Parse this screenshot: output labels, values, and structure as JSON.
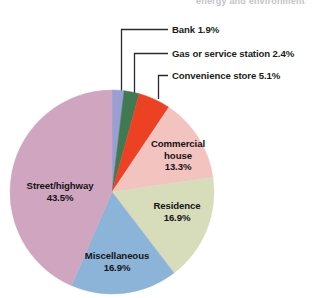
{
  "page": {
    "top_clipped_text": "energy and environment",
    "background_color": "#ffffff"
  },
  "chart_data": {
    "type": "pie",
    "title": "",
    "subtitle": "",
    "xlabel": "",
    "ylabel": "",
    "legend_position": "none",
    "grid": false,
    "label_format": "name + percent",
    "start_angle_deg": 0,
    "direction": "clockwise",
    "categories": [
      "Bank",
      "Gas or service station",
      "Convenience store",
      "Commercial house",
      "Residence",
      "Miscellaneous",
      "Street/highway"
    ],
    "values": [
      1.9,
      2.4,
      5.1,
      13.3,
      16.9,
      16.9,
      43.5
    ],
    "units": "percent",
    "colors": [
      "#9a9ed2",
      "#3f7a52",
      "#ec4123",
      "#f2c3bf",
      "#d7dcba",
      "#8cb4d8",
      "#d0a5c0"
    ],
    "slices": [
      {
        "name": "Bank",
        "value": 1.9,
        "display": "Bank 1.9%",
        "color": "#9a9ed2",
        "label_placement": "callout"
      },
      {
        "name": "Gas or service station",
        "value": 2.4,
        "display": "Gas or service station 2.4%",
        "color": "#3f7a52",
        "label_placement": "callout"
      },
      {
        "name": "Convenience store",
        "value": 5.1,
        "display": "Convenience store 5.1%",
        "color": "#ec4123",
        "label_placement": "callout"
      },
      {
        "name": "Commercial house",
        "value": 13.3,
        "display": "Commercial house 13.3%",
        "color": "#f2c3bf",
        "label_placement": "inside"
      },
      {
        "name": "Residence",
        "value": 16.9,
        "display": "Residence 16.9%",
        "color": "#d7dcba",
        "label_placement": "inside"
      },
      {
        "name": "Miscellaneous",
        "value": 16.9,
        "display": "Miscellaneous 16.9%",
        "color": "#8cb4d8",
        "label_placement": "inside"
      },
      {
        "name": "Street/highway",
        "value": 43.5,
        "display": "Street/highway 43.5%",
        "color": "#d0a5c0",
        "label_placement": "inside"
      }
    ]
  },
  "callouts": {
    "bank": "Bank 1.9%",
    "gas": "Gas or service station 2.4%",
    "convenience": "Convenience store 5.1%"
  },
  "slice_labels": {
    "commercial_name_1": "Commercial",
    "commercial_name_2": "house",
    "commercial_value": "13.3%",
    "residence_name": "Residence",
    "residence_value": "16.9%",
    "misc_name": "Miscellaneous",
    "misc_value": "16.9%",
    "street_name": "Street/highway",
    "street_value": "43.5%"
  }
}
